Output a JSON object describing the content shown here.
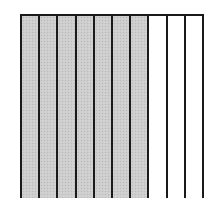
{
  "diagram": {
    "type": "fraction-area-model",
    "orientation": "vertical-strips",
    "total_parts": 10,
    "shaded_parts": 7,
    "unshaded_parts": 3,
    "strips": [
      {
        "index": 1,
        "shaded": true
      },
      {
        "index": 2,
        "shaded": true
      },
      {
        "index": 3,
        "shaded": true
      },
      {
        "index": 4,
        "shaded": true
      },
      {
        "index": 5,
        "shaded": true
      },
      {
        "index": 6,
        "shaded": true
      },
      {
        "index": 7,
        "shaded": true
      },
      {
        "index": 8,
        "shaded": false
      },
      {
        "index": 9,
        "shaded": false
      },
      {
        "index": 10,
        "shaded": false
      }
    ],
    "colors": {
      "shaded_fill": "#cdcdcd",
      "unshaded_fill": "#ffffff",
      "line": "#1a1a1a",
      "background": "#ffffff"
    }
  }
}
